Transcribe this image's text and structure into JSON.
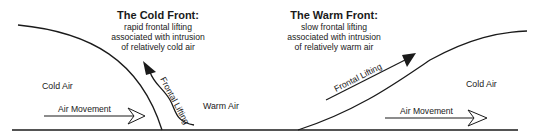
{
  "cold_front": {
    "title": "The Cold Front:",
    "lines": [
      "rapid frontal lifting",
      "associated with intrusion",
      "of relatively cold air"
    ],
    "cold_air_label": "Cold Air",
    "warm_air_label": "Warm Air",
    "movement_label": "Air Movement",
    "lifting_label": "Frontal Lifting"
  },
  "warm_front": {
    "title": "The Warm Front:",
    "lines": [
      "slow frontal lifting",
      "associated with intrusion",
      "of relatively warm air"
    ],
    "cold_air_label": "Cold Air",
    "movement_label": "Air Movement",
    "lifting_label": "Frontal Lifting"
  },
  "colors": {
    "ink": "#1a1a1a",
    "background": "#ffffff"
  }
}
